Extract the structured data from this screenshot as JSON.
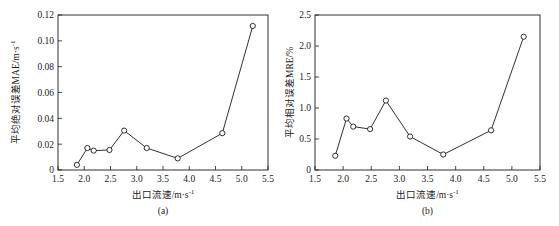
{
  "figure": {
    "panels": [
      {
        "caption": "(a)",
        "chart_ref": 0
      },
      {
        "caption": "(b)",
        "chart_ref": 1
      }
    ]
  },
  "chart_data": [
    {
      "type": "line",
      "title": "",
      "subtitle": "",
      "caption": "(a)",
      "xlabel": "出口流速/m·s",
      "xlabel_sup": "-1",
      "ylabel": "平均绝对误差MAE/m·s",
      "ylabel_sup": "-1",
      "xlim": [
        1.5,
        5.5
      ],
      "ylim": [
        0,
        0.12
      ],
      "xticks": [
        "1.5",
        "2.0",
        "2.5",
        "3.0",
        "3.5",
        "4.0",
        "4.5",
        "5.0",
        "5.5"
      ],
      "xtick_values": [
        1.5,
        2.0,
        2.5,
        3.0,
        3.5,
        4.0,
        4.5,
        5.0,
        5.5
      ],
      "yticks": [
        "0",
        "0.02",
        "0.04",
        "0.06",
        "0.08",
        "0.10",
        "0.12"
      ],
      "ytick_values": [
        0,
        0.02,
        0.04,
        0.06,
        0.08,
        0.1,
        0.12
      ],
      "grid": false,
      "legend": null,
      "marker": "open-circle",
      "line_color": "#1a1a1a",
      "x": [
        1.86,
        2.06,
        2.18,
        2.48,
        2.76,
        3.19,
        3.78,
        4.63,
        5.21
      ],
      "values": [
        0.004,
        0.017,
        0.015,
        0.0155,
        0.0305,
        0.017,
        0.009,
        0.0285,
        0.1115
      ]
    },
    {
      "type": "line",
      "title": "",
      "subtitle": "",
      "caption": "(b)",
      "xlabel": "出口流速/m·s",
      "xlabel_sup": "-1",
      "ylabel": "平均相对误差MRE/%",
      "ylabel_sup": "",
      "xlim": [
        1.5,
        5.5
      ],
      "ylim": [
        0,
        2.5
      ],
      "xticks": [
        "1.5",
        "2.0",
        "2.5",
        "3.0",
        "3.5",
        "4.0",
        "4.5",
        "5.0",
        "5.5"
      ],
      "xtick_values": [
        1.5,
        2.0,
        2.5,
        3.0,
        3.5,
        4.0,
        4.5,
        5.0,
        5.5
      ],
      "yticks": [
        "0",
        "0.5",
        "1.0",
        "1.5",
        "2.0",
        "2.5"
      ],
      "ytick_values": [
        0,
        0.5,
        1.0,
        1.5,
        2.0,
        2.5
      ],
      "grid": false,
      "legend": null,
      "marker": "open-circle",
      "line_color": "#1a1a1a",
      "x": [
        1.86,
        2.06,
        2.18,
        2.48,
        2.76,
        3.19,
        3.78,
        4.63,
        5.21
      ],
      "values": [
        0.23,
        0.83,
        0.7,
        0.66,
        1.12,
        0.54,
        0.25,
        0.64,
        2.15
      ]
    }
  ]
}
